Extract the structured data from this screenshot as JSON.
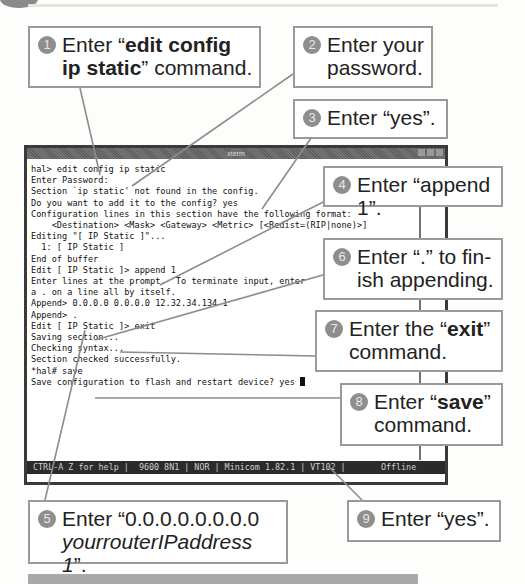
{
  "terminal": {
    "title": "xterm",
    "lines": [
      "hal> edit config ip static",
      "Enter Password:",
      "Section `ip static' not found in the config.",
      "Do you want to add it to the config? yes",
      "Configuration lines in this section have the following format:",
      "    <Destination> <Mask> <Gateway> <Metric> [<Redist=(RIP|none)>]",
      "Editing \"[ IP Static ]\"...",
      "",
      "  1: [ IP Static ]",
      "End of buffer",
      "Edit [ IP Static ]> append 1",
      "Enter lines at the prompt.  To terminate input, enter",
      "a . on a line all by itself.",
      "",
      "Append> 0.0.0.0 0.0.0.0 12.32.34.134 1",
      "Append> .",
      "Edit [ IP Static ]> exit",
      "Saving section...",
      "Checking syntax...",
      "Section checked successfully.",
      "*hal# save",
      "Save configuration to flash and restart device? yes "
    ],
    "status_bar": "CTRL-A Z for help |  9600 8N1 | NOR | Minicom 1.82.1 | VT102 |       Offline"
  },
  "callouts": [
    {
      "num": "1",
      "pre": "Enter “",
      "bold": "edit config ip static",
      "post": "” command."
    },
    {
      "num": "2",
      "text": "Enter your password."
    },
    {
      "num": "3",
      "text": "Enter “yes”."
    },
    {
      "num": "4",
      "text": "Enter “append 1”."
    },
    {
      "num": "5",
      "pre": "Enter “0.0.0.0.0.0.0.0",
      "italic": "yourrouterIPaddress 1",
      "post": "”."
    },
    {
      "num": "6",
      "text": "Enter “.” to fin-ish appending."
    },
    {
      "num": "7",
      "pre": "Enter the “",
      "bold": "exit",
      "post": "” command."
    },
    {
      "num": "8",
      "pre": "Enter “",
      "bold": "save",
      "post": "” command."
    },
    {
      "num": "9",
      "text": "Enter “yes”."
    }
  ]
}
